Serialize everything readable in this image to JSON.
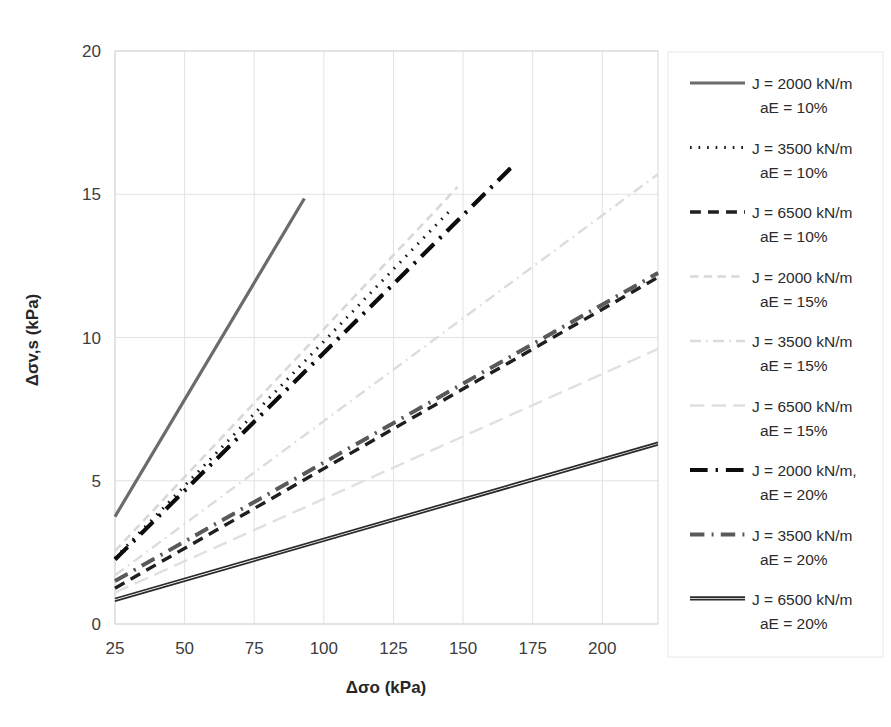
{
  "chart_data": {
    "type": "line",
    "title": "",
    "xlabel": "Δσo (kPa)",
    "ylabel": "Δσv,s (kPa)",
    "xlim": [
      25,
      220
    ],
    "ylim": [
      0,
      20
    ],
    "xticks": [
      25,
      50,
      75,
      100,
      125,
      150,
      175,
      200
    ],
    "yticks": [
      0,
      5,
      10,
      15,
      20
    ],
    "grid": true,
    "legend_position": "right",
    "series": [
      {
        "name": "J = 2000 kN/m  aE = 10%",
        "label_line1": "J = 2000 kN/m",
        "label_line2": "aE = 10%",
        "style": "solid",
        "color": "#6b6b6b",
        "width": 3.2,
        "x": [
          25,
          93
        ],
        "y": [
          3.75,
          14.85
        ]
      },
      {
        "name": "J = 3500 kN/m  aE = 10%",
        "label_line1": "J = 3500 kN/m",
        "label_line2": "aE = 10%",
        "style": "dotted",
        "color": "#1a1a1a",
        "width": 3.0,
        "x": [
          25,
          145
        ],
        "y": [
          2.3,
          14.4
        ]
      },
      {
        "name": "J = 6500 kN/m  aE = 10%",
        "label_line1": "J = 6500 kN/m",
        "label_line2": "aE = 10%",
        "style": "dashed",
        "color": "#1f1f1f",
        "width": 3.4,
        "x": [
          25,
          220
        ],
        "y": [
          1.25,
          12.1
        ]
      },
      {
        "name": "J = 2000 kN/m  aE = 15%",
        "label_line1": "J = 2000 kN/m",
        "label_line2": "aE = 15%",
        "style": "dashed",
        "color": "#d8d8d8",
        "width": 2.6,
        "x": [
          25,
          148
        ],
        "y": [
          2.55,
          15.25
        ]
      },
      {
        "name": "J = 3500 kN/m  aE = 15%",
        "label_line1": "J = 3500 kN/m",
        "label_line2": "aE = 15%",
        "style": "dashdot",
        "color": "#dcdcdc",
        "width": 2.4,
        "x": [
          25,
          220
        ],
        "y": [
          1.7,
          15.7
        ]
      },
      {
        "name": "J = 6500 kN/m  aE = 15%",
        "label_line1": "J = 6500 kN/m",
        "label_line2": "aE = 15%",
        "style": "longdash",
        "color": "#e0e0e0",
        "width": 2.4,
        "x": [
          25,
          220
        ],
        "y": [
          1.1,
          9.6
        ]
      },
      {
        "name": "J = 2000 kN/m, aE = 20%",
        "label_line1": "J = 2000 kN/m,",
        "label_line2": "aE = 20%",
        "style": "heavy-dashdot",
        "color": "#0d0d0d",
        "width": 4.2,
        "x": [
          25,
          168
        ],
        "y": [
          2.25,
          16.0
        ]
      },
      {
        "name": "J = 3500 kN/m  aE = 20%",
        "label_line1": "J = 3500 kN/m",
        "label_line2": "aE = 20%",
        "style": "dashdot-gray",
        "color": "#5a5a5a",
        "width": 4.0,
        "x": [
          25,
          220
        ],
        "y": [
          1.5,
          12.25
        ]
      },
      {
        "name": "J = 6500 kN/m  aE = 20%",
        "label_line1": "J = 6500 kN/m",
        "label_line2": "aE =  20%",
        "style": "solid-double",
        "color": "#2a2a2a",
        "width": 2.6,
        "x": [
          25,
          220
        ],
        "y": [
          0.8,
          6.25
        ]
      }
    ]
  },
  "axis": {
    "x_title": "Δσo (kPa)",
    "y_title": "Δσv,s (kPa)",
    "x_tick_labels": [
      "25",
      "50",
      "75",
      "100",
      "125",
      "150",
      "175",
      "200"
    ],
    "y_tick_labels": [
      "0",
      "5",
      "10",
      "15",
      "20"
    ]
  },
  "legend": {
    "items": [
      {
        "line1": "J = 2000 kN/m",
        "line2": "aE = 10%"
      },
      {
        "line1": "J = 3500 kN/m",
        "line2": "aE = 10%"
      },
      {
        "line1": "J = 6500 kN/m",
        "line2": "aE = 10%"
      },
      {
        "line1": "J = 2000 kN/m",
        "line2": "aE = 15%"
      },
      {
        "line1": "J = 3500 kN/m",
        "line2": "aE = 15%"
      },
      {
        "line1": "J = 6500 kN/m",
        "line2": "aE = 15%"
      },
      {
        "line1": "J = 2000 kN/m,",
        "line2": "aE = 20%"
      },
      {
        "line1": "J = 3500 kN/m",
        "line2": "aE = 20%"
      },
      {
        "line1": "J = 6500 kN/m",
        "line2": "aE =  20%"
      }
    ]
  }
}
